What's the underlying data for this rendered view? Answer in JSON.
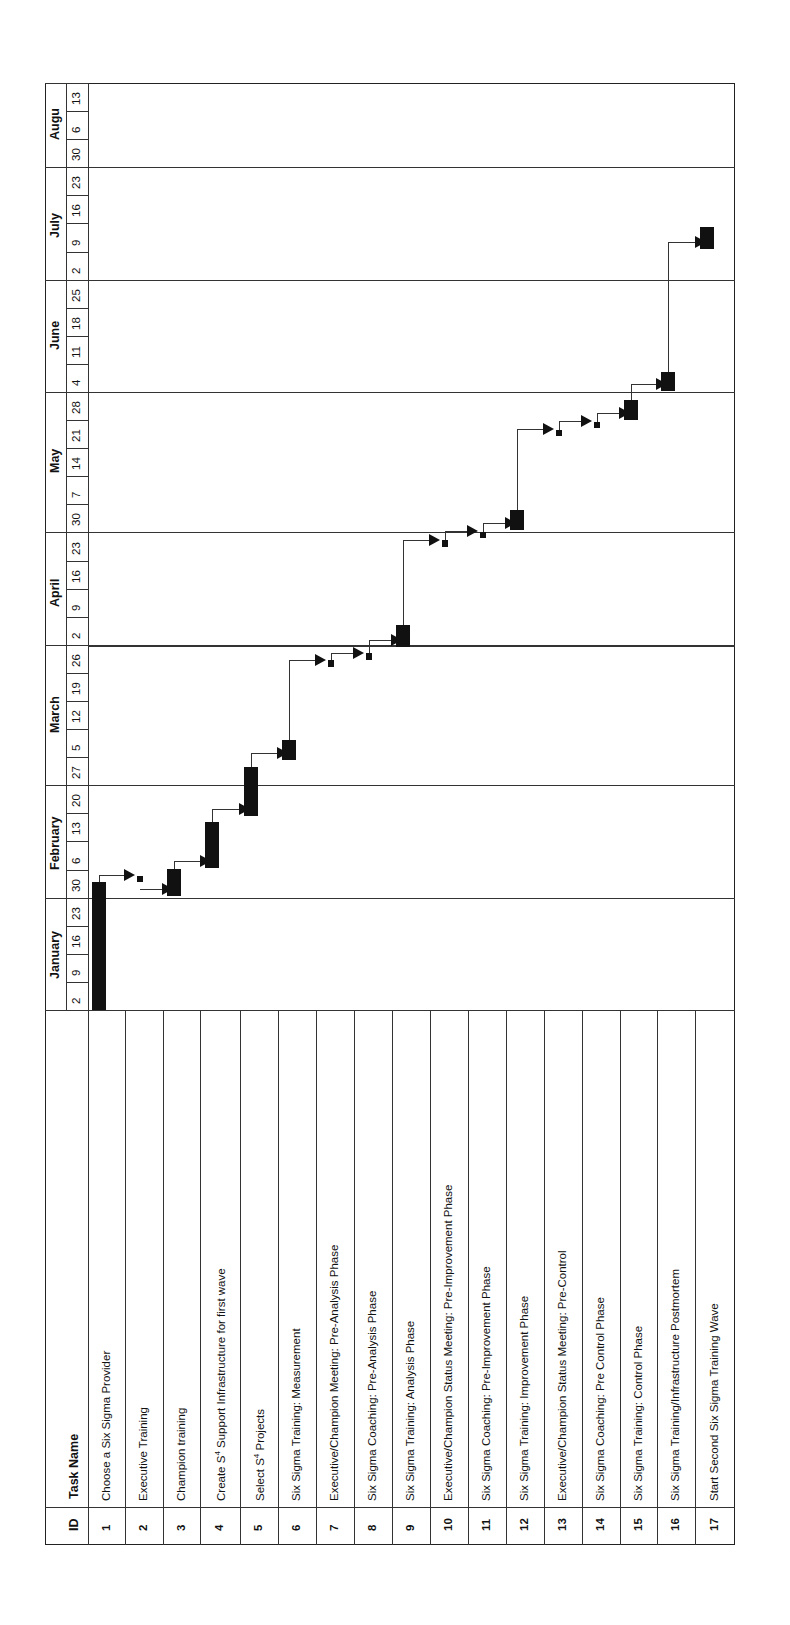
{
  "chart_data": {
    "type": "gantt",
    "title": "",
    "orientation": "rotated-90-ccw",
    "columns": {
      "id_header": "ID",
      "task_header": "Task Name"
    },
    "timescale": {
      "months": [
        {
          "label": "January",
          "weeks": [
            "2",
            "9",
            "16",
            "23"
          ]
        },
        {
          "label": "February",
          "weeks": [
            "30",
            "6",
            "13",
            "20"
          ]
        },
        {
          "label": "March",
          "weeks": [
            "27",
            "5",
            "12",
            "19",
            "26"
          ]
        },
        {
          "label": "April",
          "weeks": [
            "2",
            "9",
            "16",
            "23"
          ]
        },
        {
          "label": "May",
          "weeks": [
            "30",
            "7",
            "14",
            "21",
            "28"
          ]
        },
        {
          "label": "June",
          "weeks": [
            "4",
            "11",
            "18",
            "25"
          ]
        },
        {
          "label": "July",
          "weeks": [
            "2",
            "9",
            "16",
            "23"
          ]
        },
        {
          "label": "Augu",
          "weeks": [
            "30",
            "6",
            "13"
          ]
        }
      ]
    },
    "tasks": [
      {
        "id": "1",
        "name": "Choose a Six Sigma Provider",
        "start": "Jan 2",
        "end": "Jan 29"
      },
      {
        "id": "2",
        "name": "Executive Training",
        "start": "Jan 30",
        "end": "Jan 31"
      },
      {
        "id": "3",
        "name": "Champion training",
        "start": "Feb 1",
        "end": "Feb 3"
      },
      {
        "id": "4",
        "name": "Create S4 Support Infrastructure for first wave",
        "start": "Feb 5",
        "end": "Feb 16"
      },
      {
        "id": "5",
        "name": "Select S4 Projects",
        "start": "Feb 19",
        "end": "Mar 2"
      },
      {
        "id": "6",
        "name": "Six Sigma Training: Measurement",
        "start": "Mar 5",
        "end": "Mar 9"
      },
      {
        "id": "7",
        "name": "Executive/Champion Meeting: Pre-Analysis Phase",
        "start": "Mar 23",
        "end": "Mar 26"
      },
      {
        "id": "8",
        "name": "Six Sigma Coaching: Pre-Analysis Phase",
        "start": "Mar 27",
        "end": "Mar 29"
      },
      {
        "id": "9",
        "name": "Six Sigma Training: Analysis Phase",
        "start": "Apr 2",
        "end": "Apr 6"
      },
      {
        "id": "10",
        "name": "Executive/Champion Status Meeting: Pre-Improvement Phase",
        "start": "Apr 20",
        "end": "Apr 23"
      },
      {
        "id": "11",
        "name": "Six Sigma Coaching: Pre-Improvement Phase",
        "start": "Apr 24",
        "end": "Apr 27"
      },
      {
        "id": "12",
        "name": "Six Sigma Training: Improvement Phase",
        "start": "Apr 30",
        "end": "May 4"
      },
      {
        "id": "13",
        "name": "Executive/Champion Status Meeting: Pre-Control",
        "start": "May 18",
        "end": "May 21"
      },
      {
        "id": "14",
        "name": "Six Sigma Coaching: Pre Control Phase",
        "start": "May 22",
        "end": "May 25"
      },
      {
        "id": "15",
        "name": "Six Sigma Training: Control Phase",
        "start": "May 28",
        "end": "Jun 1"
      },
      {
        "id": "16",
        "name": "Six Sigma Training/Infrastructure Postmortem",
        "start": "Jun 4",
        "end": "Jun 8"
      },
      {
        "id": "17",
        "name": "Start Second Six Sigma Training Wave",
        "start": "Jul 9",
        "end": "Jul 13"
      }
    ],
    "dependencies": "finish-to-start chain 1→2→3→…→17",
    "month_gridlines": [
      "Jan 30",
      "Feb 27",
      "Mar 26",
      "Apr 30",
      "May 28",
      "Jun 25",
      "Jul 30"
    ]
  },
  "labels": {
    "id_header": "ID",
    "task_header": "Task Name"
  }
}
